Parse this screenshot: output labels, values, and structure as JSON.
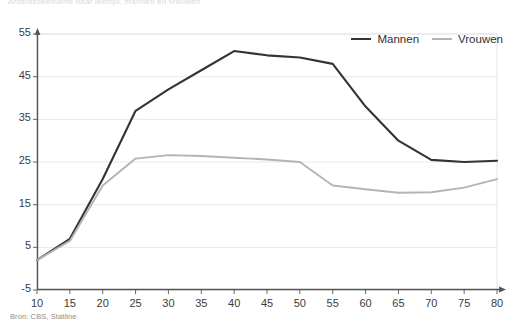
{
  "chart_data": {
    "type": "line",
    "title": "Arbeidsdeelname naar leeftijd, mannen en vrouwen",
    "xlabel": "",
    "ylabel": "",
    "xlim": [
      10,
      80
    ],
    "ylim": [
      -5,
      55
    ],
    "xticks": [
      10,
      15,
      20,
      25,
      30,
      35,
      40,
      45,
      50,
      55,
      60,
      65,
      70,
      75,
      80
    ],
    "yticks": [
      -5,
      5,
      15,
      25,
      35,
      45,
      55
    ],
    "grid": true,
    "legend_position": "top-right",
    "x": [
      10,
      15,
      20,
      25,
      30,
      35,
      40,
      45,
      50,
      55,
      60,
      65,
      70,
      75,
      80
    ],
    "series": [
      {
        "name": "Mannen",
        "color": "#333333",
        "values": [
          2,
          7,
          21,
          37,
          42,
          46.5,
          51,
          50,
          49.5,
          48,
          38,
          30,
          25.5,
          25,
          25.3
        ]
      },
      {
        "name": "Vrouwen",
        "color": "#b4b4b4",
        "values": [
          2,
          6.5,
          19.5,
          25.8,
          26.6,
          26.4,
          26,
          25.6,
          25,
          19.5,
          18.6,
          17.8,
          17.9,
          19,
          21
        ]
      }
    ],
    "source": "Bron: CBS, Statline"
  },
  "legend": {
    "items": [
      {
        "label": "Mannen"
      },
      {
        "label": "Vrouwen"
      }
    ]
  },
  "axis": {
    "y_labels": [
      "55",
      "45",
      "35",
      "25",
      "15",
      "5",
      "-5"
    ],
    "x_labels": [
      "10",
      "15",
      "20",
      "25",
      "30",
      "35",
      "40",
      "45",
      "50",
      "55",
      "60",
      "65",
      "70",
      "75",
      "80"
    ]
  }
}
